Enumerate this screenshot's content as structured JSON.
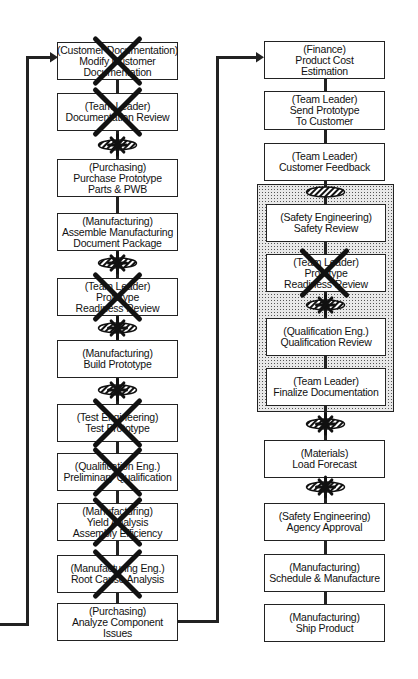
{
  "left_column": [
    {
      "role": "(Customer Documentation)",
      "lines": [
        "Modify Customer",
        "Documentation"
      ],
      "crossed": true,
      "top": 42,
      "h": 38
    },
    {
      "role": "(Team Leader)",
      "lines": [
        "Documentation Review"
      ],
      "crossed": true,
      "top": 93,
      "h": 38
    },
    {
      "role": "(Purchasing)",
      "lines": [
        "Purchase Prototype",
        "Parts & PWB"
      ],
      "crossed": false,
      "top": 159,
      "h": 38
    },
    {
      "role": "(Manufacturing)",
      "lines": [
        "Assemble Manufacturing",
        "Document Package"
      ],
      "crossed": false,
      "top": 213,
      "h": 38
    },
    {
      "role": "(Team Leader)",
      "lines": [
        "Prototype",
        "Readiness Review"
      ],
      "crossed": true,
      "top": 278,
      "h": 38
    },
    {
      "role": "(Manufacturing)",
      "lines": [
        "Build Prototype"
      ],
      "crossed": false,
      "top": 340,
      "h": 38
    },
    {
      "role": "(Test Engineering)",
      "lines": [
        "Test Prototype"
      ],
      "crossed": true,
      "top": 404,
      "h": 38
    },
    {
      "role": "(Qualification Eng.)",
      "lines": [
        "Preliminary Qualification"
      ],
      "crossed": true,
      "top": 453,
      "h": 38
    },
    {
      "role": "(Manufacturing)",
      "lines": [
        "Yield Analysis",
        "Assembly Efficiency"
      ],
      "crossed": true,
      "top": 503,
      "h": 38
    },
    {
      "role": "(Manufacturing Eng.)",
      "lines": [
        "Root Cause Analysis"
      ],
      "crossed": true,
      "top": 555,
      "h": 38
    },
    {
      "role": "(Purchasing)",
      "lines": [
        "Analyze Component",
        "Issues"
      ],
      "crossed": false,
      "top": 603,
      "h": 38
    }
  ],
  "right_column": [
    {
      "role": "(Finance)",
      "lines": [
        "Product Cost",
        "Estimation"
      ],
      "crossed": false,
      "top": 41,
      "h": 38
    },
    {
      "role": "(Team Leader)",
      "lines": [
        "Send Prototype",
        "To Customer"
      ],
      "crossed": false,
      "top": 91,
      "h": 39
    },
    {
      "role": "(Team Leader)",
      "lines": [
        "Customer Feedback"
      ],
      "crossed": false,
      "top": 143,
      "h": 38
    },
    {
      "role": "(Safety Engineering)",
      "lines": [
        "Safety Review"
      ],
      "crossed": false,
      "top": 204,
      "h": 38
    },
    {
      "role": "(Team Leader)",
      "lines": [
        "Prototype",
        "Readiness Review"
      ],
      "crossed": true,
      "top": 254,
      "h": 38
    },
    {
      "role": "(Qualification Eng.)",
      "lines": [
        "Qualification Review"
      ],
      "crossed": false,
      "top": 318,
      "h": 38
    },
    {
      "role": "(Team Leader)",
      "lines": [
        "Finalize Documentation"
      ],
      "crossed": false,
      "top": 368,
      "h": 38
    },
    {
      "role": "(Materials)",
      "lines": [
        "Load Forecast"
      ],
      "crossed": false,
      "top": 440,
      "h": 38
    },
    {
      "role": "(Safety Engineering)",
      "lines": [
        "Agency Approval"
      ],
      "crossed": false,
      "top": 503,
      "h": 38
    },
    {
      "role": "(Manufacturing)",
      "lines": [
        "Schedule & Manufacture"
      ],
      "crossed": false,
      "top": 554,
      "h": 38
    },
    {
      "role": "(Manufacturing)",
      "lines": [
        "Ship Product"
      ],
      "crossed": false,
      "top": 604,
      "h": 38
    }
  ],
  "gates_left": [
    {
      "y": 145,
      "star": true
    },
    {
      "y": 263,
      "star": true
    },
    {
      "y": 328,
      "star": true
    },
    {
      "y": 390,
      "star": true
    }
  ],
  "gates_right": [
    {
      "y": 192,
      "star": false
    },
    {
      "y": 305,
      "star": true
    },
    {
      "y": 424,
      "star": true
    },
    {
      "y": 487,
      "star": true
    }
  ],
  "shaded_group": {
    "left": 257,
    "top": 184,
    "width": 137,
    "height": 228
  },
  "colors": {
    "line": "#222222",
    "shade": "#e8e8e8",
    "cross": "#111111"
  }
}
